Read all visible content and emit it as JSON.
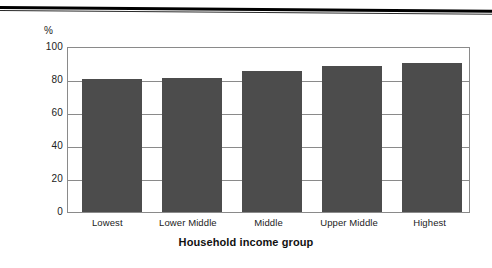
{
  "figure": {
    "background_color": "#ffffff",
    "top_rule_color": "#000000"
  },
  "chart_data": {
    "type": "bar",
    "title": "",
    "subtitle": "",
    "categories": [
      "Lowest",
      "Lower Middle",
      "Middle",
      "Upper Middle",
      "Highest"
    ],
    "values": [
      81,
      82,
      86,
      89,
      91
    ],
    "series": [
      {
        "name": "",
        "values": [
          81,
          82,
          86,
          89,
          91
        ]
      }
    ],
    "xlabel": "Household income group",
    "ylabel": "",
    "y_unit_label": "%",
    "ylim": [
      0,
      100
    ],
    "y_ticks": [
      0,
      20,
      40,
      60,
      80,
      100
    ],
    "y_tick_labels": [
      "0",
      "20",
      "40",
      "60",
      "80",
      "100"
    ],
    "grid": true,
    "grid_axis": "y",
    "legend": false,
    "legend_position": "none",
    "bar_color": "#4c4c4c",
    "axis_color": "#8a8a8a",
    "annotations": []
  }
}
